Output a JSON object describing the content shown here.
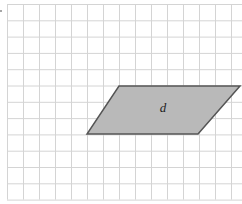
{
  "figure": {
    "type": "grid-diagram",
    "background": "#ffffff",
    "grid": {
      "origin_x": 7,
      "origin_y": 4,
      "cell_width": 16,
      "cell_height": 16.3,
      "columns": 15,
      "rows": 12,
      "line_color": "#d4d4d4"
    },
    "shape": {
      "kind": "parallelogram",
      "label": "d",
      "fill": "#b9b9b9",
      "stroke": "#555555",
      "vertices": [
        {
          "x": 119,
          "y": 86
        },
        {
          "x": 240,
          "y": 86
        },
        {
          "x": 198,
          "y": 134
        },
        {
          "x": 87,
          "y": 134
        }
      ],
      "label_position": {
        "x": 163,
        "y": 112
      }
    }
  }
}
